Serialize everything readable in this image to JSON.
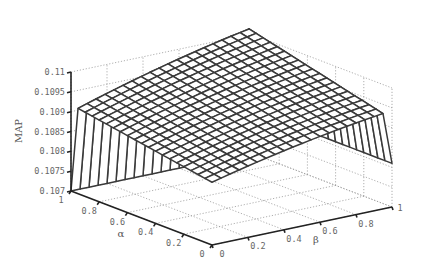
{
  "chart_data": {
    "type": "surface3d",
    "title": "",
    "xlabel": "β",
    "ylabel": "α",
    "zlabel": "MAP",
    "x_ticks": [
      "0",
      "0.2",
      "0.4",
      "0.6",
      "0.8",
      "1"
    ],
    "y_ticks": [
      "0",
      "0.2",
      "0.4",
      "0.6",
      "0.8",
      "1"
    ],
    "z_ticks": [
      "0.107",
      "0.1075",
      "0.108",
      "0.1085",
      "0.109",
      "0.1095",
      "0.11"
    ],
    "xlim": [
      0,
      1
    ],
    "ylim": [
      0,
      1
    ],
    "zlim": [
      0.107,
      0.11
    ],
    "grid": true,
    "mesh_resolution": 0.05,
    "sample_points": [
      {
        "alpha": 0.0,
        "beta": 0.0,
        "map": 0.10875
      },
      {
        "alpha": 0.0,
        "beta": 0.5,
        "map": 0.109
      },
      {
        "alpha": 0.0,
        "beta": 0.95,
        "map": 0.1092
      },
      {
        "alpha": 0.0,
        "beta": 1.0,
        "map": 0.1081
      },
      {
        "alpha": 0.5,
        "beta": 0.0,
        "map": 0.1089
      },
      {
        "alpha": 0.5,
        "beta": 0.5,
        "map": 0.1093
      },
      {
        "alpha": 0.5,
        "beta": 0.95,
        "map": 0.1095
      },
      {
        "alpha": 0.95,
        "beta": 0.0,
        "map": 0.1085
      },
      {
        "alpha": 0.95,
        "beta": 0.5,
        "map": 0.1095
      },
      {
        "alpha": 0.95,
        "beta": 0.95,
        "map": 0.1097
      },
      {
        "alpha": 1.0,
        "beta": 0.0,
        "map": 0.107
      },
      {
        "alpha": 1.0,
        "beta": 1.0,
        "map": 0.107
      }
    ]
  },
  "labels": {
    "z_axis": "MAP",
    "alpha_axis": "α",
    "beta_axis": "β"
  }
}
